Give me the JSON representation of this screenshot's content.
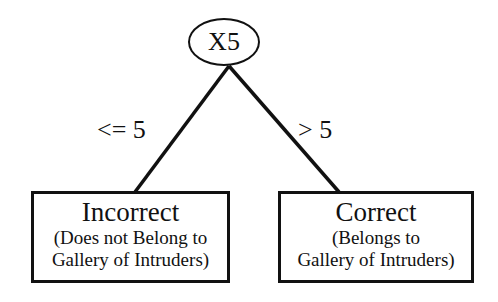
{
  "diagram": {
    "type": "decision-tree",
    "root": {
      "label": "X5"
    },
    "edges": [
      {
        "label": "<= 5",
        "to": "left"
      },
      {
        "label": "> 5",
        "to": "right"
      }
    ],
    "leaves": {
      "left": {
        "title": "Incorrect",
        "line1": "(Does not Belong to",
        "line2": "Gallery of Intruders)"
      },
      "right": {
        "title": "Correct",
        "line1": "(Belongs to",
        "line2": "Gallery of Intruders)"
      }
    }
  }
}
